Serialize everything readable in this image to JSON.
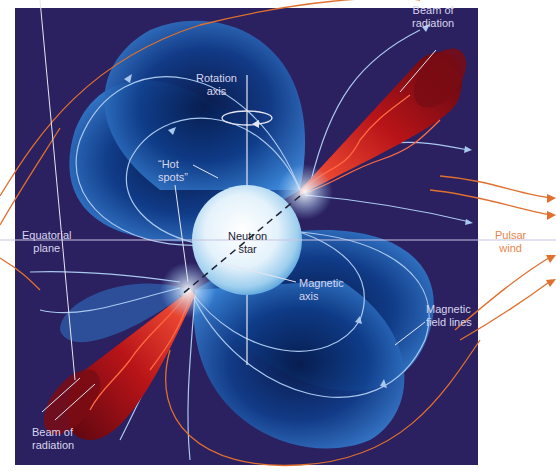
{
  "figure": {
    "colors": {
      "background_panel": "#2b2060",
      "page_background": "#ffffff",
      "field_lobe": "#2e6fc2",
      "field_line": "#a9c8ee",
      "beam": "#a8141a",
      "pulsar_wind": "#e0702e",
      "star": "#e8f4fb",
      "axis_line": "#e6e6f2",
      "label_text_light": "#d8d6ee",
      "label_text_orange": "#e9854a"
    }
  },
  "labels": {
    "beam_top": [
      "Beam of",
      "radiation"
    ],
    "rotation_axis": [
      "Rotation",
      "axis"
    ],
    "hot_spots": [
      "“Hot",
      "spots”"
    ],
    "equatorial_plane": [
      "Equatorial",
      "plane"
    ],
    "neutron_star": [
      "Neutron",
      "star"
    ],
    "pulsar_wind": [
      "Pulsar",
      "wind"
    ],
    "magnetic_axis": [
      "Magnetic",
      "axis"
    ],
    "magnetic_field_lines": [
      "Magnetic",
      "field lines"
    ],
    "beam_bottom": [
      "Beam of",
      "radiation"
    ]
  },
  "icons": {
    "rotation_arrow": "counterclockwise-ellipse-arrow",
    "field_direction_arrows": "triangle-arrowheads",
    "wind_arrows": "orange-arrowheads"
  }
}
